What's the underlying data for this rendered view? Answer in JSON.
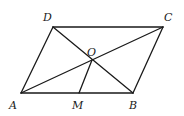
{
  "diagram": {
    "type": "geometry",
    "points": {
      "A": {
        "label": "A",
        "x": 21,
        "y": 93,
        "label_x": 9,
        "label_y": 109
      },
      "B": {
        "label": "B",
        "x": 133,
        "y": 93,
        "label_x": 129,
        "label_y": 109
      },
      "C": {
        "label": "C",
        "x": 163,
        "y": 27,
        "label_x": 164,
        "label_y": 21
      },
      "D": {
        "label": "D",
        "x": 53,
        "y": 27,
        "label_x": 43,
        "label_y": 21
      },
      "O": {
        "label": "O",
        "x": 92,
        "y": 60,
        "label_x": 87,
        "label_y": 56
      },
      "M": {
        "label": "M",
        "x": 79,
        "y": 93,
        "label_x": 72,
        "label_y": 109
      }
    },
    "segments": [
      {
        "name": "AB",
        "from": "A",
        "to": "B"
      },
      {
        "name": "BC",
        "from": "B",
        "to": "C"
      },
      {
        "name": "CD",
        "from": "C",
        "to": "D"
      },
      {
        "name": "DA",
        "from": "D",
        "to": "A"
      },
      {
        "name": "AC",
        "from": "A",
        "to": "C"
      },
      {
        "name": "BD",
        "from": "B",
        "to": "D"
      },
      {
        "name": "OM",
        "from": "O",
        "to": "M"
      }
    ]
  }
}
